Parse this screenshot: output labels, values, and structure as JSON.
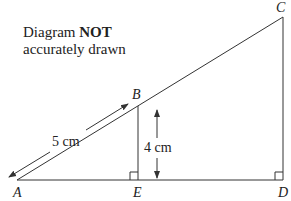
{
  "note": {
    "line1_prefix": "Diagram",
    "line1_bold": "NOT",
    "line2": "accurately drawn"
  },
  "points": {
    "A": {
      "label": "A",
      "x": 17,
      "y": 180
    },
    "B": {
      "label": "B",
      "x": 138,
      "y": 106
    },
    "C": {
      "label": "C",
      "x": 283,
      "y": 17
    },
    "D": {
      "label": "D",
      "x": 283,
      "y": 180
    },
    "E": {
      "label": "E",
      "x": 138,
      "y": 180
    }
  },
  "measurements": {
    "AB": "5 cm",
    "BE": "4 cm"
  },
  "right_angles": [
    "E",
    "D"
  ],
  "colors": {
    "line": "#333333",
    "text": "#222222"
  }
}
